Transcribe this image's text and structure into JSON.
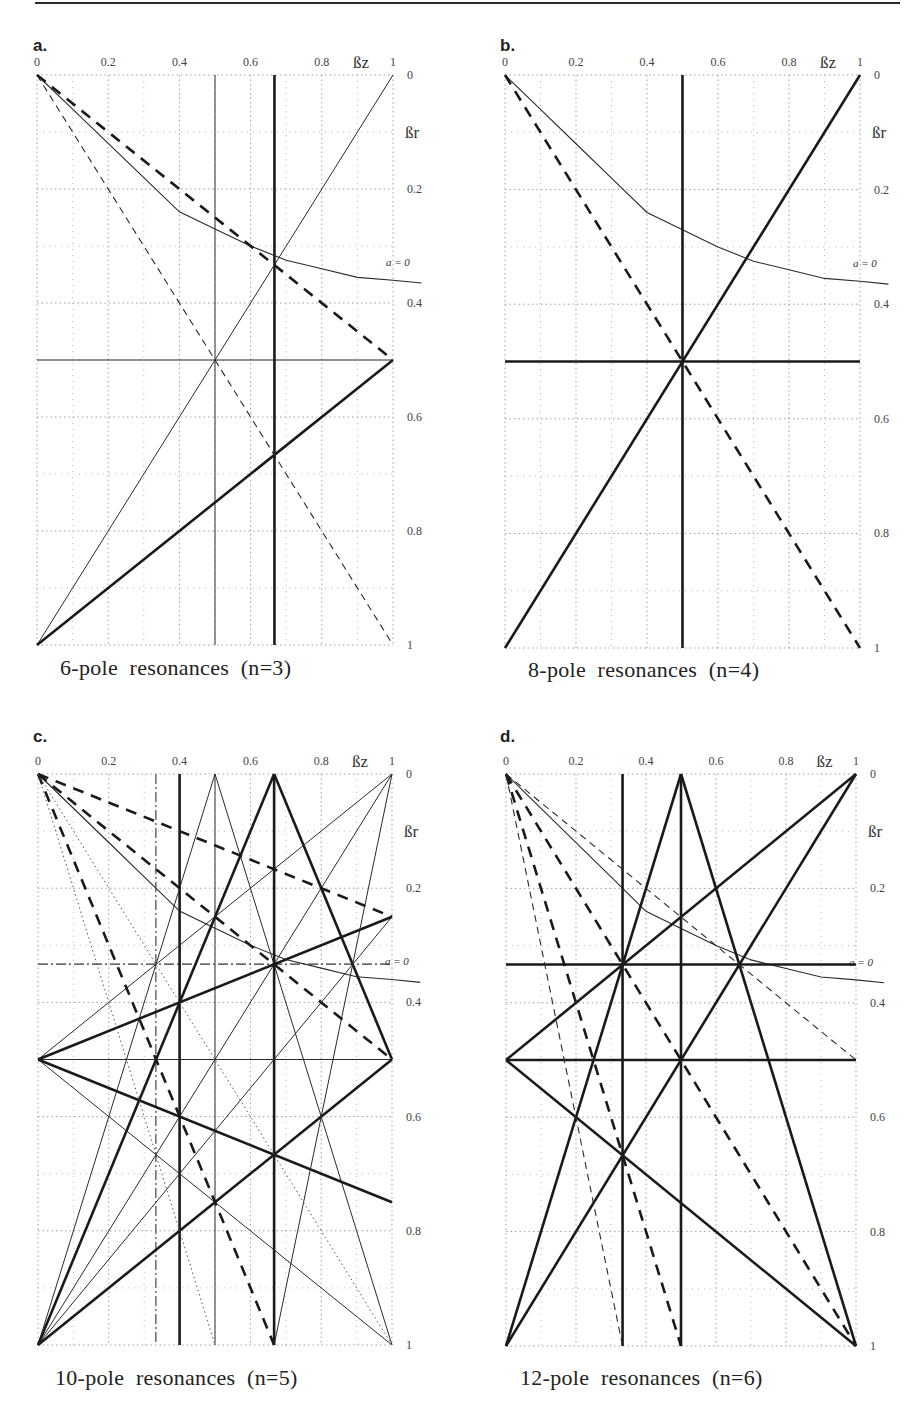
{
  "figure": {
    "panels": [
      {
        "id": "a",
        "letter": "a.",
        "caption": "6-pole  resonances  (n=3)"
      },
      {
        "id": "b",
        "letter": "b.",
        "caption": "8-pole  resonances  (n=4)"
      },
      {
        "id": "c",
        "letter": "c.",
        "caption": "10-pole  resonances  (n=5)"
      },
      {
        "id": "d",
        "letter": "d.",
        "caption": "12-pole  resonances  (n=6)"
      }
    ],
    "axes": {
      "x_label": "ßz",
      "y_label": "ßr",
      "x_ticks": [
        "0",
        "0.2",
        "0.4",
        "0.6",
        "0.8",
        "1"
      ],
      "y_ticks": [
        "0",
        "0.2",
        "0.4",
        "0.6",
        "0.8",
        "1"
      ],
      "curve_label": "a = 0"
    }
  },
  "chart_data": [
    {
      "type": "line",
      "title": "6-pole resonances (n=3)",
      "panel": "a",
      "xlabel": "βz",
      "ylabel": "βr",
      "xlim": [
        0,
        1
      ],
      "ylim": [
        0,
        1
      ],
      "y_inverted": true,
      "grid": true,
      "x_ticks": [
        0,
        0.2,
        0.4,
        0.6,
        0.8,
        1
      ],
      "y_ticks": [
        0,
        0.2,
        0.4,
        0.6,
        0.8,
        1
      ],
      "curve": {
        "label": "a = 0",
        "points": [
          [
            0,
            0
          ],
          [
            0.1,
            0.06
          ],
          [
            0.2,
            0.12
          ],
          [
            0.3,
            0.18
          ],
          [
            0.4,
            0.24
          ],
          [
            0.5,
            0.27
          ],
          [
            0.6,
            0.3
          ],
          [
            0.7,
            0.325
          ],
          [
            0.8,
            0.34
          ],
          [
            0.9,
            0.355
          ],
          [
            1.0,
            0.36
          ],
          [
            1.08,
            0.365
          ]
        ]
      },
      "series": [
        {
          "name": "βz=1/2",
          "style": "thin",
          "points": [
            [
              0.5,
              0
            ],
            [
              0.5,
              1
            ]
          ]
        },
        {
          "name": "βz=2/3",
          "style": "thick",
          "points": [
            [
              0.667,
              0
            ],
            [
              0.667,
              1
            ]
          ]
        },
        {
          "name": "βr=1/2",
          "style": "thin",
          "points": [
            [
              0,
              0.5
            ],
            [
              1,
              0.5
            ]
          ]
        },
        {
          "name": "βz+βr... (0,1)-(1,0)",
          "style": "thin",
          "points": [
            [
              0,
              1
            ],
            [
              1,
              0
            ]
          ]
        },
        {
          "name": "thick (0,1)-(1,0.5)",
          "style": "thick",
          "points": [
            [
              0,
              1
            ],
            [
              1,
              0.5
            ]
          ]
        },
        {
          "name": "dashed thin (0,0)-(1,1)",
          "style": "dashed-thin",
          "points": [
            [
              0,
              0
            ],
            [
              1,
              1
            ]
          ]
        },
        {
          "name": "dashed thick (0,0)-(1,0.5)",
          "style": "dashed-thick",
          "points": [
            [
              0,
              0
            ],
            [
              1,
              0.5
            ]
          ]
        }
      ]
    },
    {
      "type": "line",
      "title": "8-pole resonances (n=4)",
      "panel": "b",
      "xlabel": "βz",
      "ylabel": "βr",
      "xlim": [
        0,
        1
      ],
      "ylim": [
        0,
        1
      ],
      "y_inverted": true,
      "grid": true,
      "x_ticks": [
        0,
        0.2,
        0.4,
        0.6,
        0.8,
        1
      ],
      "y_ticks": [
        0,
        0.2,
        0.4,
        0.6,
        0.8,
        1
      ],
      "curve": {
        "label": "a = 0",
        "points": [
          [
            0,
            0
          ],
          [
            0.1,
            0.06
          ],
          [
            0.2,
            0.12
          ],
          [
            0.3,
            0.18
          ],
          [
            0.4,
            0.24
          ],
          [
            0.5,
            0.27
          ],
          [
            0.6,
            0.3
          ],
          [
            0.7,
            0.325
          ],
          [
            0.8,
            0.34
          ],
          [
            0.9,
            0.355
          ],
          [
            1.0,
            0.36
          ],
          [
            1.08,
            0.365
          ]
        ]
      },
      "series": [
        {
          "name": "βz=1/2",
          "style": "thick",
          "points": [
            [
              0.5,
              0
            ],
            [
              0.5,
              1
            ]
          ]
        },
        {
          "name": "βr=1/2",
          "style": "thick",
          "points": [
            [
              0,
              0.5
            ],
            [
              1,
              0.5
            ]
          ]
        },
        {
          "name": "thick (0,1)-(1,0)",
          "style": "thick",
          "points": [
            [
              0,
              1
            ],
            [
              1,
              0
            ]
          ]
        },
        {
          "name": "dashed thick (0,0)-(1,1)",
          "style": "dashed-thick",
          "points": [
            [
              0,
              0
            ],
            [
              1,
              1
            ]
          ]
        }
      ]
    },
    {
      "type": "line",
      "title": "10-pole resonances (n=5)",
      "panel": "c",
      "xlabel": "βz",
      "ylabel": "βr",
      "xlim": [
        0,
        1
      ],
      "ylim": [
        0,
        1
      ],
      "y_inverted": true,
      "grid": true,
      "x_ticks": [
        0,
        0.2,
        0.4,
        0.6,
        0.8,
        1
      ],
      "y_ticks": [
        0,
        0.2,
        0.4,
        0.6,
        0.8,
        1
      ],
      "curve": {
        "label": "a = 0",
        "points": [
          [
            0,
            0
          ],
          [
            0.1,
            0.06
          ],
          [
            0.2,
            0.12
          ],
          [
            0.3,
            0.18
          ],
          [
            0.4,
            0.24
          ],
          [
            0.5,
            0.27
          ],
          [
            0.6,
            0.3
          ],
          [
            0.7,
            0.325
          ],
          [
            0.8,
            0.34
          ],
          [
            0.9,
            0.355
          ],
          [
            1.0,
            0.36
          ],
          [
            1.08,
            0.365
          ]
        ]
      },
      "series": [
        {
          "name": "βz=1/3 dash-dot",
          "style": "dashdot",
          "points": [
            [
              0.333,
              0
            ],
            [
              0.333,
              1
            ]
          ]
        },
        {
          "name": "βz=2/5",
          "style": "thick",
          "points": [
            [
              0.4,
              0
            ],
            [
              0.4,
              1
            ]
          ]
        },
        {
          "name": "βz=1/2",
          "style": "thin",
          "points": [
            [
              0.5,
              0
            ],
            [
              0.5,
              1
            ]
          ]
        },
        {
          "name": "βz=2/3",
          "style": "thick",
          "points": [
            [
              0.667,
              0
            ],
            [
              0.667,
              1
            ]
          ]
        },
        {
          "name": "βr=1/3 dash-dot",
          "style": "dashdot",
          "points": [
            [
              0,
              0.333
            ],
            [
              1,
              0.333
            ]
          ]
        },
        {
          "name": "βr=1/2",
          "style": "thin",
          "points": [
            [
              0,
              0.5
            ],
            [
              1,
              0.5
            ]
          ]
        },
        {
          "name": "(0,1)-(1,0)",
          "style": "thin",
          "points": [
            [
              0,
              1
            ],
            [
              1,
              0
            ]
          ]
        },
        {
          "name": "(0,1)-(0.5,0)",
          "style": "thin",
          "points": [
            [
              0,
              1
            ],
            [
              0.5,
              0
            ]
          ]
        },
        {
          "name": "(0.5,0)-(1,1)",
          "style": "thin",
          "points": [
            [
              0.5,
              0
            ],
            [
              1,
              1
            ]
          ]
        },
        {
          "name": "(0,1)-(0.667,0)",
          "style": "thick",
          "points": [
            [
              0,
              1
            ],
            [
              0.667,
              0
            ]
          ]
        },
        {
          "name": "(0.667,0)-(1,0.5)",
          "style": "thick",
          "points": [
            [
              0.667,
              0
            ],
            [
              1,
              0.5
            ]
          ]
        },
        {
          "name": "(0,1)-(1,0.5)",
          "style": "thick",
          "points": [
            [
              0,
              1
            ],
            [
              1,
              0.5
            ]
          ]
        },
        {
          "name": "(0,1)-(1,0.25)",
          "style": "thin",
          "points": [
            [
              0,
              1
            ],
            [
              1,
              0.25
            ]
          ]
        },
        {
          "name": "(0,0.5)-(1,0)",
          "style": "thin",
          "points": [
            [
              0,
              0.5
            ],
            [
              1,
              0
            ]
          ]
        },
        {
          "name": "(0,0.5)-(1,0.25)",
          "style": "thick",
          "points": [
            [
              0,
              0.5
            ],
            [
              1,
              0.25
            ]
          ]
        },
        {
          "name": "(0,0.5)-(1,0.75)",
          "style": "thick",
          "points": [
            [
              0,
              0.5
            ],
            [
              1,
              0.75
            ]
          ]
        },
        {
          "name": "(0,0.5)-(1,1)",
          "style": "thin",
          "points": [
            [
              0,
              0.5
            ],
            [
              1,
              1
            ]
          ]
        },
        {
          "name": "(1,0)-(0,1) via (0.667,0)",
          "style": "thin",
          "points": [
            [
              1,
              0
            ],
            [
              0.667,
              1
            ]
          ]
        },
        {
          "name": "dashed (0,0)-(1,0.25)",
          "style": "dashed-thick",
          "points": [
            [
              0,
              0
            ],
            [
              1,
              0.25
            ]
          ]
        },
        {
          "name": "dashed (0,0)-(1,0.5)",
          "style": "dashed-thick",
          "points": [
            [
              0,
              0
            ],
            [
              1,
              0.5
            ]
          ]
        },
        {
          "name": "dashed (0,0)-(0.667,1)",
          "style": "dashed-thick",
          "points": [
            [
              0,
              0
            ],
            [
              0.667,
              1
            ]
          ]
        },
        {
          "name": "dotted (0,0)-(0.5,1)",
          "style": "dotted",
          "points": [
            [
              0,
              0
            ],
            [
              0.5,
              1
            ]
          ]
        },
        {
          "name": "dotted (0,0)-(1,1)",
          "style": "dotted",
          "points": [
            [
              0,
              0
            ],
            [
              1,
              1
            ]
          ]
        }
      ]
    },
    {
      "type": "line",
      "title": "12-pole resonances (n=6)",
      "panel": "d",
      "xlabel": "βz",
      "ylabel": "βr",
      "xlim": [
        0,
        1
      ],
      "ylim": [
        0,
        1
      ],
      "y_inverted": true,
      "grid": true,
      "x_ticks": [
        0,
        0.2,
        0.4,
        0.6,
        0.8,
        1
      ],
      "y_ticks": [
        0,
        0.2,
        0.4,
        0.6,
        0.8,
        1
      ],
      "curve": {
        "label": "a = 0",
        "points": [
          [
            0,
            0
          ],
          [
            0.1,
            0.06
          ],
          [
            0.2,
            0.12
          ],
          [
            0.3,
            0.18
          ],
          [
            0.4,
            0.24
          ],
          [
            0.5,
            0.27
          ],
          [
            0.6,
            0.3
          ],
          [
            0.7,
            0.325
          ],
          [
            0.8,
            0.34
          ],
          [
            0.9,
            0.355
          ],
          [
            1.0,
            0.36
          ],
          [
            1.08,
            0.365
          ]
        ]
      },
      "series": [
        {
          "name": "βz=1/3",
          "style": "thick",
          "points": [
            [
              0.333,
              0
            ],
            [
              0.333,
              1
            ]
          ]
        },
        {
          "name": "βz=1/2",
          "style": "thick",
          "points": [
            [
              0.5,
              0
            ],
            [
              0.5,
              1
            ]
          ]
        },
        {
          "name": "βr=1/3",
          "style": "thick",
          "points": [
            [
              0,
              0.333
            ],
            [
              1,
              0.333
            ]
          ]
        },
        {
          "name": "βr=1/2",
          "style": "thick",
          "points": [
            [
              0,
              0.5
            ],
            [
              1,
              0.5
            ]
          ]
        },
        {
          "name": "(0,1)-(0.5,0)",
          "style": "thick",
          "points": [
            [
              0,
              1
            ],
            [
              0.5,
              0
            ]
          ]
        },
        {
          "name": "(0.5,0)-(1,1)",
          "style": "thick",
          "points": [
            [
              0.5,
              0
            ],
            [
              1,
              1
            ]
          ]
        },
        {
          "name": "(0,1)-(1,0)",
          "style": "thick",
          "points": [
            [
              0,
              1
            ],
            [
              1,
              0
            ]
          ]
        },
        {
          "name": "(0,0.5)-(1,0)",
          "style": "thick",
          "points": [
            [
              0,
              0.5
            ],
            [
              1,
              0
            ]
          ]
        },
        {
          "name": "(0,0.5)-(1,1)",
          "style": "thick",
          "points": [
            [
              0,
              0.5
            ],
            [
              1,
              1
            ]
          ]
        },
        {
          "name": "dashed (0,0)-(1,0.5)",
          "style": "dashed-thin",
          "points": [
            [
              0,
              0
            ],
            [
              1,
              0.5
            ]
          ]
        },
        {
          "name": "dashed (0,0)-(0.5,1)",
          "style": "dashed-thick",
          "points": [
            [
              0,
              0
            ],
            [
              0.5,
              1
            ]
          ]
        },
        {
          "name": "dashed (0,0)-(1,1)",
          "style": "dashed-thick",
          "points": [
            [
              0,
              0
            ],
            [
              1,
              1
            ]
          ]
        },
        {
          "name": "dashed (0,0)-(0.333,1)",
          "style": "dashed-thin",
          "points": [
            [
              0,
              0
            ],
            [
              0.333,
              1
            ]
          ]
        }
      ]
    }
  ]
}
